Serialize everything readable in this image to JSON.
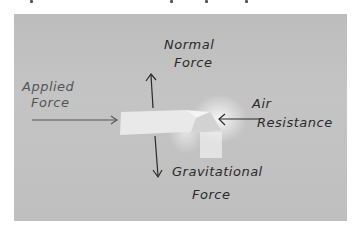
{
  "diagram": {
    "type": "free-body force diagram (photo of hand-drawn sketch)",
    "labels": {
      "normal_force": [
        "Normal",
        "Force"
      ],
      "applied_force": [
        "Applied",
        "Force"
      ],
      "air_resistance": [
        "Air",
        "Resistance"
      ],
      "gravitational_force": [
        "Gravitational",
        "Force"
      ]
    },
    "arrows": [
      {
        "name": "normal-force",
        "direction": "up"
      },
      {
        "name": "applied-force",
        "direction": "right"
      },
      {
        "name": "air-resistance",
        "direction": "left"
      },
      {
        "name": "gravitational-force",
        "direction": "down"
      }
    ],
    "colors": {
      "paper": "#c0c0c0",
      "ink": "#2a2a2a",
      "applied_ink": "#555555",
      "background": "#ffffff"
    }
  }
}
